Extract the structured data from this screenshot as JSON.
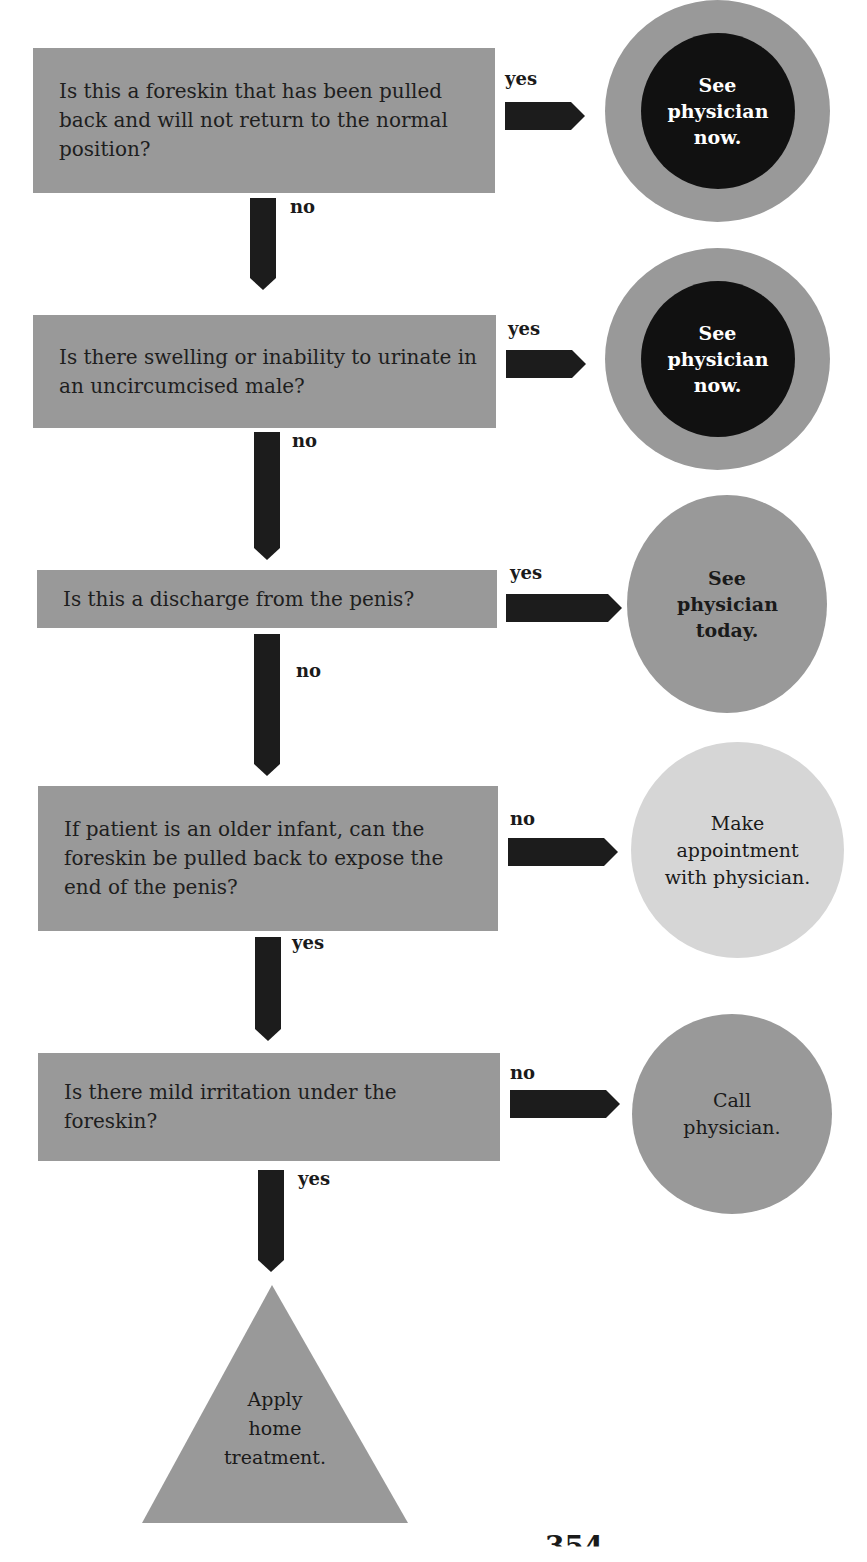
{
  "flowchart": {
    "questions": [
      {
        "text": "Is this a foreskin that has been pulled back and will not return to the normal position?",
        "side_label": "yes",
        "down_label": "no"
      },
      {
        "text": "Is there swelling or inability to urinate in an uncircumcised male?",
        "side_label": "yes",
        "down_label": "no"
      },
      {
        "text": "Is this a discharge from the penis?",
        "side_label": "yes",
        "down_label": "no"
      },
      {
        "text": "If patient is an older infant, can the foreskin be pulled back to expose the end of the penis?",
        "side_label": "no",
        "down_label": "yes"
      },
      {
        "text": "Is there mild irritation under the foreskin?",
        "side_label": "no",
        "down_label": "yes"
      }
    ],
    "outcomes": [
      {
        "text": "See physician now.",
        "style": "emergency",
        "color": "#111111"
      },
      {
        "text": "See physician now.",
        "style": "emergency",
        "color": "#111111"
      },
      {
        "text": "See physician today.",
        "style": "urgent",
        "color": "#999999"
      },
      {
        "text": "Make appointment with physician.",
        "style": "appointment",
        "color": "#d6d6d6"
      },
      {
        "text": "Call physician.",
        "style": "call",
        "color": "#999999"
      }
    ],
    "final": {
      "text": "Apply home treatment.",
      "color": "#999999"
    }
  },
  "page": {
    "number_fragment": "354"
  }
}
